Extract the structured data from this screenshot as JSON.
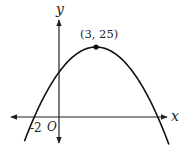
{
  "chart_data": {
    "type": "line",
    "title": "",
    "xlabel": "x",
    "ylabel": "y",
    "origin_label": "O",
    "function": "y = -(x - 3)^2 + 25",
    "series": [
      {
        "name": "parabola",
        "x": [
          -2.8,
          -2,
          -1,
          0,
          1,
          2,
          3,
          4,
          5,
          6,
          7,
          8,
          8.9
        ],
        "y": [
          -8.64,
          0,
          9,
          16,
          21,
          24,
          25,
          24,
          21,
          16,
          9,
          0,
          -9.81
        ]
      }
    ],
    "annotations": [
      {
        "type": "point",
        "x": 3,
        "y": 25,
        "label": "(3, 25)"
      },
      {
        "type": "tick_label",
        "x": -2,
        "y": 0,
        "label": "-2"
      }
    ],
    "xlim": [
      -4,
      9.5
    ],
    "ylim": [
      -9,
      34
    ],
    "grid": false,
    "legend": "none"
  },
  "labels": {
    "x_axis": "x",
    "y_axis": "y",
    "origin": "O",
    "vertex": "(3, 25)",
    "neg_intercept": "-2"
  }
}
